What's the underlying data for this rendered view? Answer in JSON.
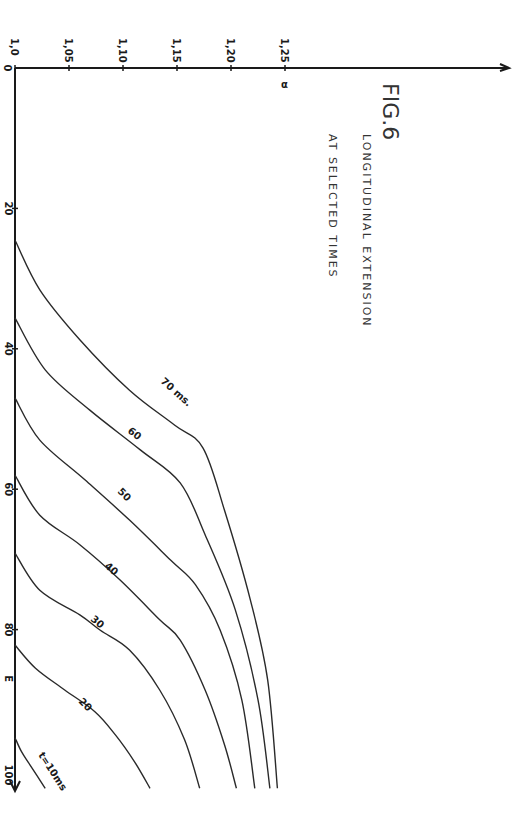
{
  "chart_data": {
    "type": "line",
    "title": "FIG.6",
    "subtitle_lines": [
      "LONGITUDINAL EXTENSION",
      "AT SELECTED TIMES"
    ],
    "orientation": "rotated-90",
    "xlabel": "α",
    "ylabel": "E",
    "xlim": [
      1.0,
      1.25
    ],
    "ylim": [
      0,
      100
    ],
    "x_ticks": [
      1.0,
      1.05,
      1.1,
      1.15,
      1.2,
      1.25
    ],
    "x_tick_labels": [
      "1,0",
      "1,05",
      "1,10",
      "1,15",
      "1,20",
      "1,25"
    ],
    "y_ticks": [
      0,
      20,
      40,
      60,
      80,
      100
    ],
    "y_tick_labels": [
      "0",
      "20",
      "40",
      "60",
      "80",
      "100"
    ],
    "grid": false,
    "series": [
      {
        "name": "t=10ms",
        "label": "t=10ms",
        "points": [
          [
            1.0,
            95.4
          ],
          [
            1.006,
            97.4
          ],
          [
            1.014,
            99.3
          ],
          [
            1.028,
            102.6
          ]
        ]
      },
      {
        "name": "20 ms",
        "label": "20",
        "points": [
          [
            1.0,
            82.2
          ],
          [
            1.019,
            85.5
          ],
          [
            1.046,
            88.6
          ],
          [
            1.074,
            91.7
          ],
          [
            1.093,
            95.0
          ],
          [
            1.111,
            98.9
          ],
          [
            1.125,
            102.6
          ]
        ]
      },
      {
        "name": "30 ms",
        "label": "30",
        "points": [
          [
            1.0,
            69.1
          ],
          [
            1.023,
            74.4
          ],
          [
            1.06,
            77.9
          ],
          [
            1.079,
            80.1
          ],
          [
            1.106,
            82.9
          ],
          [
            1.134,
            88.6
          ],
          [
            1.157,
            95.7
          ],
          [
            1.171,
            102.6
          ]
        ]
      },
      {
        "name": "40 ms",
        "label": "40",
        "points": [
          [
            1.0,
            58.0
          ],
          [
            1.023,
            63.7
          ],
          [
            1.06,
            67.9
          ],
          [
            1.097,
            72.9
          ],
          [
            1.134,
            78.6
          ],
          [
            1.153,
            81.5
          ],
          [
            1.176,
            88.6
          ],
          [
            1.194,
            96.4
          ],
          [
            1.205,
            102.6
          ]
        ]
      },
      {
        "name": "50 ms",
        "label": "50",
        "points": [
          [
            1.0,
            47.0
          ],
          [
            1.023,
            53.0
          ],
          [
            1.065,
            58.7
          ],
          [
            1.106,
            64.4
          ],
          [
            1.144,
            70.1
          ],
          [
            1.167,
            73.6
          ],
          [
            1.19,
            80.1
          ],
          [
            1.21,
            90.0
          ],
          [
            1.222,
            102.6
          ]
        ]
      },
      {
        "name": "60 ms",
        "label": "60",
        "points": [
          [
            1.0,
            35.6
          ],
          [
            1.028,
            43.0
          ],
          [
            1.069,
            48.7
          ],
          [
            1.116,
            54.4
          ],
          [
            1.153,
            59.1
          ],
          [
            1.176,
            66.5
          ],
          [
            1.204,
            77.2
          ],
          [
            1.225,
            90.0
          ],
          [
            1.236,
            102.6
          ]
        ]
      },
      {
        "name": "70 ms",
        "label": "70 ms.",
        "points": [
          [
            1.0,
            24.5
          ],
          [
            1.023,
            31.6
          ],
          [
            1.06,
            38.7
          ],
          [
            1.106,
            45.9
          ],
          [
            1.148,
            50.9
          ],
          [
            1.174,
            54.1
          ],
          [
            1.194,
            63.0
          ],
          [
            1.218,
            75.8
          ],
          [
            1.234,
            87.2
          ],
          [
            1.243,
            102.6
          ]
        ]
      }
    ]
  }
}
